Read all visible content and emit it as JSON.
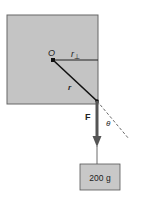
{
  "diagram": {
    "type": "torque-diagram",
    "labels": {
      "pivot": "O",
      "perp_arm": "r",
      "perp_sub": "⊥",
      "radius": "r",
      "force": "F",
      "angle": "θ",
      "mass": "200 g"
    },
    "colors": {
      "plate": "#c4c4c4",
      "plate_border": "#555555",
      "box": "#c8c8c8",
      "line": "#1a1a1a",
      "force_arrow": "#555555"
    }
  }
}
